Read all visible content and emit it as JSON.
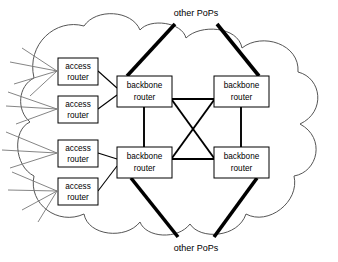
{
  "diagram": {
    "colors": {
      "stroke": "#000000",
      "background": "#ffffff",
      "cloud_stroke": "#555555",
      "subscriber_line": "#777777",
      "box_fill": "#ffffff"
    },
    "labels": {
      "pops_top": "other PoPs",
      "pops_bottom": "other PoPs"
    },
    "access_routers": [
      {
        "id": "ar1",
        "line1": "access",
        "line2": "router",
        "x": 58,
        "y": 58,
        "w": 40,
        "h": 27
      },
      {
        "id": "ar2",
        "line1": "access",
        "line2": "router",
        "x": 58,
        "y": 96,
        "w": 40,
        "h": 27
      },
      {
        "id": "ar3",
        "line1": "access",
        "line2": "router",
        "x": 58,
        "y": 140,
        "w": 40,
        "h": 27
      },
      {
        "id": "ar4",
        "line1": "access",
        "line2": "router",
        "x": 58,
        "y": 178,
        "w": 40,
        "h": 27
      }
    ],
    "backbone_routers": [
      {
        "id": "br-tl",
        "line1": "backbone",
        "line2": "router",
        "x": 117,
        "y": 76,
        "w": 55,
        "h": 31
      },
      {
        "id": "br-tr",
        "line1": "backbone",
        "line2": "router",
        "x": 214,
        "y": 76,
        "w": 55,
        "h": 31
      },
      {
        "id": "br-bl",
        "line1": "backbone",
        "line2": "router",
        "x": 117,
        "y": 147,
        "w": 55,
        "h": 31
      },
      {
        "id": "br-br",
        "line1": "backbone",
        "line2": "router",
        "x": 214,
        "y": 147,
        "w": 55,
        "h": 31
      }
    ],
    "backbone_links": [
      {
        "from": "br-tl",
        "to": "br-tr",
        "kind": "horizontal-top"
      },
      {
        "from": "br-bl",
        "to": "br-br",
        "kind": "horizontal-bottom"
      },
      {
        "from": "br-tl",
        "to": "br-bl",
        "kind": "vertical-left"
      },
      {
        "from": "br-tr",
        "to": "br-br",
        "kind": "vertical-right"
      },
      {
        "from": "br-tl",
        "to": "br-br",
        "kind": "diagonal"
      },
      {
        "from": "br-tr",
        "to": "br-bl",
        "kind": "diagonal"
      }
    ],
    "access_links": [
      {
        "from": "ar1",
        "to": "br-tl"
      },
      {
        "from": "ar2",
        "to": "br-tl"
      },
      {
        "from": "ar3",
        "to": "br-bl"
      },
      {
        "from": "ar4",
        "to": "br-bl"
      }
    ],
    "trunk_links": [
      {
        "from": "br-tl",
        "direction": "up-right",
        "target": "other PoPs"
      },
      {
        "from": "br-tr",
        "direction": "up-left",
        "target": "other PoPs"
      },
      {
        "from": "br-bl",
        "direction": "down-right",
        "target": "other PoPs"
      },
      {
        "from": "br-br",
        "direction": "down-left",
        "target": "other PoPs"
      }
    ],
    "subscriber_line_count": 14
  }
}
